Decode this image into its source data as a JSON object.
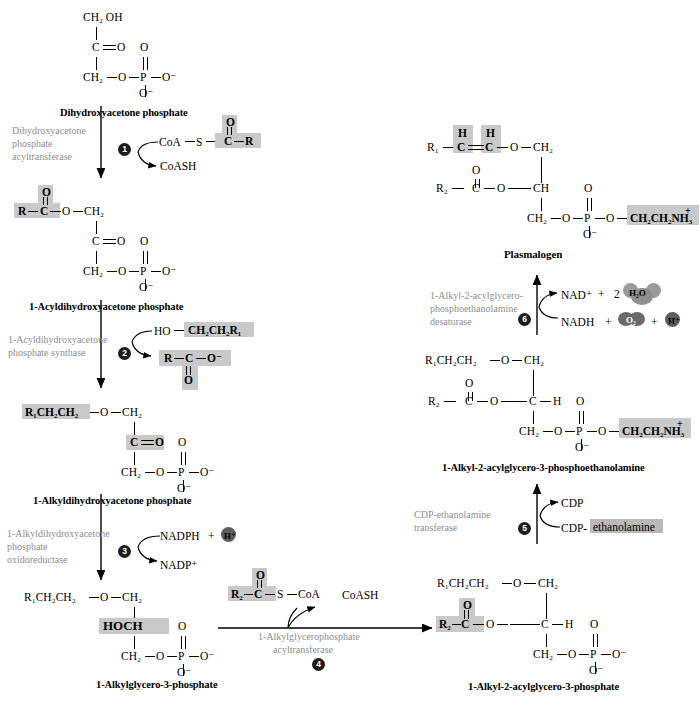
{
  "figure": {
    "highlight_color": "#c9c9c9",
    "enzyme_color": "#8d8d8d",
    "step_circle_color": "#1c1c1c"
  },
  "molecules": {
    "dhap": {
      "name": "Dihydroxyacetone phosphate",
      "a_ch2oh": "CH₂ OH",
      "a_c": "C",
      "a_o_dbl": "O",
      "a_ch2": "CH₂",
      "a_o_link": "O",
      "a_p": "P",
      "a_o_top": "O",
      "a_o_right": "O⁻",
      "a_o_bottom": "O⁻"
    },
    "acyl_dhap": {
      "name": "1-Acyldihydroxyacetone phosphate",
      "a_r": "R",
      "a_c_acyl": "C",
      "a_o_acyl": "O",
      "a_o_ester": "O",
      "a_ch2": "CH₂",
      "a_c": "C",
      "a_o_dbl": "O",
      "a_ch2b": "CH₂",
      "a_o_link": "O",
      "a_p": "P",
      "a_o_top": "O",
      "a_o_right": "O⁻",
      "a_o_bottom": "O⁻"
    },
    "alkyl_dhap": {
      "name": "1-Alkyldihydroxyacetone phosphate",
      "a_r1chain": "R₁CH₂CH₂",
      "a_o_ether": "O",
      "a_ch2": "CH₂",
      "a_c": "C",
      "a_o_dbl": "O",
      "a_ch2b": "CH₂",
      "a_o_link": "O",
      "a_p": "P",
      "a_o_top": "O",
      "a_o_right": "O⁻",
      "a_o_bottom": "O⁻"
    },
    "alkyl_g3p": {
      "name": "1-Alkylglycero-3-phosphate",
      "a_r1chain": "R₁CH₂CH₂",
      "a_o_ether": "O",
      "a_ch2": "CH₂",
      "a_hoch": "HOCH",
      "a_ch2b": "CH₂",
      "a_o_link": "O",
      "a_p": "P",
      "a_o_top": "O",
      "a_o_right": "O⁻",
      "a_o_bottom": "O⁻"
    },
    "alkyl_acyl_g3p": {
      "name": "1-Alkyl-2-acylglycero-3-phosphate",
      "a_r1chain": "R₁CH₂CH₂",
      "a_o_ether": "O",
      "a_ch2": "CH₂",
      "a_r2": "R₂",
      "a_c_acyl": "C",
      "a_o_acyl": "O",
      "a_o_ester": "O",
      "a_c": "C",
      "a_h": "H",
      "a_ch2b": "CH₂",
      "a_o_link": "O",
      "a_p": "P",
      "a_o_top": "O",
      "a_o_right": "O⁻",
      "a_o_bottom": "O⁻"
    },
    "alkyl_acyl_gpe": {
      "name": "1-Alkyl-2-acylglycero-3-phosphoethanolamine",
      "a_r1chain": "R₁CH₂CH₂",
      "a_o_ether": "O",
      "a_ch2": "CH₂",
      "a_r2": "R₂",
      "a_c_acyl": "C",
      "a_o_acyl": "O",
      "a_o_ester": "O",
      "a_c": "C",
      "a_h": "H",
      "a_ch2b": "CH₂",
      "a_o_link": "O",
      "a_p": "P",
      "a_o_top": "O",
      "a_o_right": "O",
      "a_o_bottom": "O⁻",
      "a_headgroup": "CH₂CH₂NH₃",
      "a_headgroup_charge": "+"
    },
    "plasmalogen": {
      "name": "Plasmalogen",
      "a_r1": "R₁",
      "a_h_left": "H",
      "a_h_right": "H",
      "a_c_vinyl_l": "C",
      "a_c_vinyl_r": "C",
      "a_o_ether": "O",
      "a_ch2": "CH₂",
      "a_r2": "R₂",
      "a_c_acyl": "C",
      "a_o_acyl": "O",
      "a_o_ester": "O",
      "a_ch": "CH",
      "a_ch2b": "CH₂",
      "a_o_link": "O",
      "a_p": "P",
      "a_o_top": "O",
      "a_o_right": "O",
      "a_o_bottom": "O⁻",
      "a_headgroup": "CH₂CH₂NH₃",
      "a_headgroup_charge": "+"
    }
  },
  "steps": [
    {
      "number": "1",
      "enzyme_lines": [
        "Dihydroxyacetone",
        "phosphate",
        "acyltransferase"
      ],
      "substrate": "CoA",
      "substrate_s": "S",
      "substrate_c": "C",
      "substrate_o": "O",
      "substrate_r": "R",
      "product": "CoASH"
    },
    {
      "number": "2",
      "enzyme_lines": [
        "1-Acyldihydroxyacetone",
        "phosphate synthase"
      ],
      "substrate_ho": "HO",
      "substrate_chain": "CH₂CH₂R₁",
      "product_r": "R",
      "product_c": "C",
      "product_o_minus": "O⁻",
      "product_o": "O"
    },
    {
      "number": "3",
      "enzyme_lines": [
        "1-Alkyldihydroxyacetone",
        "phosphate",
        "oxidoreductase"
      ],
      "substrate": "NADPH",
      "substrate_plus": "+",
      "substrate_proton": "H⁺",
      "product": "NADP⁺"
    },
    {
      "number": "4",
      "enzyme_lines": [
        "1-Alkylglycerophosphate",
        "acyltransferase"
      ],
      "substrate_r2": "R₂",
      "substrate_c": "C",
      "substrate_o": "O",
      "substrate_s": "S",
      "substrate_coa": "CoA",
      "product": "CoASH"
    },
    {
      "number": "5",
      "enzyme_lines": [
        "CDP-ethanolamine",
        "transferase"
      ],
      "substrate_prefix": "CDP-",
      "substrate_highlight": "ethanolamine",
      "product": "CDP"
    },
    {
      "number": "6",
      "enzyme_lines": [
        "1-Alkyl-2-acylglycero-",
        "phosphoethanolamine",
        "desaturase"
      ],
      "substrate_nadh": "NADH",
      "substrate_plus1": "+",
      "substrate_o2": "O₂",
      "substrate_plus2": "+",
      "substrate_proton": "H⁺",
      "product_nad": "NAD⁺",
      "product_plus": "+",
      "product_coef": "2",
      "product_h2o": "H₂O"
    }
  ]
}
